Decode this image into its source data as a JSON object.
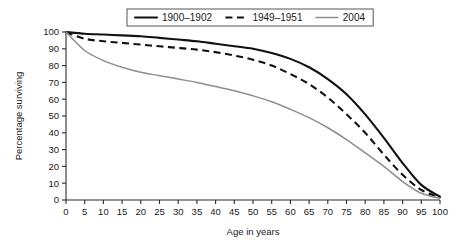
{
  "chart_data": {
    "type": "line",
    "title": "",
    "xlabel": "Age in years",
    "ylabel": "Percentage surviving",
    "xlim": [
      0,
      100
    ],
    "ylim": [
      0,
      100
    ],
    "xticks": [
      0,
      5,
      10,
      15,
      20,
      25,
      30,
      35,
      40,
      45,
      50,
      55,
      60,
      65,
      70,
      75,
      80,
      85,
      90,
      95,
      100
    ],
    "yticks": [
      0,
      10,
      20,
      30,
      40,
      50,
      60,
      70,
      80,
      90,
      100
    ],
    "grid": false,
    "legend_position": "top-center",
    "x": [
      0,
      5,
      10,
      15,
      20,
      25,
      30,
      35,
      40,
      45,
      50,
      55,
      60,
      65,
      70,
      75,
      80,
      85,
      90,
      95,
      100
    ],
    "series": [
      {
        "name": "1900–1902",
        "style": "solid",
        "color": "#111111",
        "values": [
          100,
          99,
          98.5,
          98,
          97.5,
          96.5,
          95.5,
          94.5,
          93,
          91.5,
          90,
          87.5,
          84,
          79,
          72,
          63,
          51,
          37,
          22,
          9,
          2
        ]
      },
      {
        "name": "1949–1951",
        "style": "dashed",
        "color": "#111111",
        "values": [
          100,
          96,
          94.5,
          93.5,
          92.5,
          91.5,
          90.5,
          89.5,
          88,
          86,
          83.5,
          80,
          75,
          69,
          61,
          51,
          40,
          27,
          15,
          6,
          1.5
        ]
      },
      {
        "name": "2004",
        "style": "solid",
        "color": "#8e8e8e",
        "values": [
          100,
          89,
          83,
          79,
          76,
          74,
          72,
          70,
          67.5,
          65,
          62,
          58.5,
          54,
          49,
          43,
          36,
          28,
          20,
          11,
          4,
          1
        ]
      }
    ]
  },
  "legend": {
    "items": [
      {
        "label": "1900–1902",
        "style": "solid",
        "color": "#111111"
      },
      {
        "label": "1949–1951",
        "style": "dashed",
        "color": "#111111"
      },
      {
        "label": "2004",
        "style": "solid",
        "color": "#8e8e8e"
      }
    ]
  },
  "axes": {
    "x_title": "Age in years",
    "y_title": "Percentage surviving"
  }
}
